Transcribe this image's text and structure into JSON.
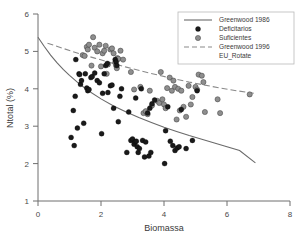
{
  "chart_data": {
    "type": "scatter",
    "title": "",
    "xlabel": "Biomassa",
    "ylabel": "Ntotal (%)",
    "xlim": [
      0,
      8
    ],
    "ylim": [
      1,
      6
    ],
    "xticks": [
      0,
      2,
      4,
      6,
      8
    ],
    "yticks": [
      1,
      2,
      3,
      4,
      5,
      6
    ],
    "grid": false,
    "legend_position": "top-right",
    "legend": [
      {
        "label": "Greenwood 1986",
        "marker": "line-solid",
        "color": "#6a6a6a"
      },
      {
        "label": "Deficitarios",
        "marker": "circle-filled-black",
        "color": "#1a1a1a"
      },
      {
        "label": "Suficientes",
        "marker": "circle-filled-gray",
        "color": "#8e8e8e"
      },
      {
        "label": "Greenwood 1996",
        "marker": "line-dashed",
        "color": "#8a8a8a"
      },
      {
        "label": "EU_Rotate",
        "marker": "none",
        "color": "#3a3a3a"
      }
    ],
    "series": [
      {
        "name": "Deficitarios",
        "marker": "circle-filled-black",
        "color": "#1a1a1a",
        "points": [
          [
            1.05,
            2.7
          ],
          [
            1.12,
            3.42
          ],
          [
            1.15,
            2.48
          ],
          [
            1.18,
            3.8
          ],
          [
            1.2,
            4.78
          ],
          [
            1.25,
            2.95
          ],
          [
            1.3,
            4.4
          ],
          [
            1.32,
            4.38
          ],
          [
            1.35,
            4.12
          ],
          [
            1.38,
            4.22
          ],
          [
            1.45,
            3.08
          ],
          [
            1.5,
            4.4
          ],
          [
            1.55,
            4.02
          ],
          [
            1.58,
            3.95
          ],
          [
            1.62,
            3.98
          ],
          [
            1.68,
            4.3
          ],
          [
            1.72,
            4.33
          ],
          [
            1.8,
            4.42
          ],
          [
            1.88,
            4.22
          ],
          [
            1.95,
            4.16
          ],
          [
            2.02,
            2.8
          ],
          [
            2.05,
            3.88
          ],
          [
            2.1,
            4.4
          ],
          [
            2.15,
            4.62
          ],
          [
            2.2,
            4.68
          ],
          [
            2.22,
            3.9
          ],
          [
            2.3,
            4.08
          ],
          [
            2.35,
            4.1
          ],
          [
            2.4,
            3.48
          ],
          [
            2.45,
            4.78
          ],
          [
            2.48,
            4.72
          ],
          [
            2.5,
            4.62
          ],
          [
            2.55,
            3.12
          ],
          [
            2.6,
            3.8
          ],
          [
            2.65,
            4.0
          ],
          [
            2.82,
            2.3
          ],
          [
            2.88,
            3.38
          ],
          [
            2.95,
            2.62
          ],
          [
            3.0,
            2.66
          ],
          [
            3.05,
            2.52
          ],
          [
            3.08,
            2.58
          ],
          [
            3.1,
            3.75
          ],
          [
            3.12,
            2.6
          ],
          [
            3.15,
            2.45
          ],
          [
            3.18,
            2.3
          ],
          [
            3.22,
            2.4
          ],
          [
            3.28,
            4.0
          ],
          [
            3.32,
            2.62
          ],
          [
            3.38,
            2.18
          ],
          [
            3.42,
            2.58
          ],
          [
            3.48,
            3.35
          ],
          [
            3.52,
            2.2
          ],
          [
            3.55,
            3.48
          ],
          [
            3.58,
            2.3
          ],
          [
            3.62,
            3.6
          ],
          [
            3.7,
            3.7
          ],
          [
            4.02,
            2.0
          ],
          [
            4.05,
            2.88
          ],
          [
            4.12,
            3.52
          ],
          [
            4.2,
            2.6
          ],
          [
            4.28,
            2.48
          ],
          [
            4.35,
            2.35
          ],
          [
            4.42,
            2.42
          ],
          [
            4.48,
            2.45
          ],
          [
            4.55,
            3.45
          ],
          [
            4.7,
            2.4
          ],
          [
            4.9,
            2.62
          ],
          [
            5.05,
            3.95
          ]
        ]
      },
      {
        "name": "Suficientes",
        "marker": "circle-filled-gray",
        "color": "#8e8e8e",
        "points": [
          [
            1.42,
            4.9
          ],
          [
            1.48,
            4.88
          ],
          [
            1.55,
            5.12
          ],
          [
            1.58,
            5.05
          ],
          [
            1.62,
            5.18
          ],
          [
            1.7,
            4.62
          ],
          [
            1.75,
            5.38
          ],
          [
            1.8,
            5.1
          ],
          [
            1.88,
            5.0
          ],
          [
            1.95,
            5.18
          ],
          [
            2.0,
            4.6
          ],
          [
            2.05,
            4.95
          ],
          [
            2.1,
            5.02
          ],
          [
            2.15,
            5.15
          ],
          [
            2.18,
            4.4
          ],
          [
            2.22,
            4.65
          ],
          [
            2.3,
            5.05
          ],
          [
            2.35,
            5.08
          ],
          [
            2.4,
            4.95
          ],
          [
            2.45,
            4.7
          ],
          [
            2.48,
            4.62
          ],
          [
            2.5,
            4.55
          ],
          [
            2.52,
            4.82
          ],
          [
            2.55,
            4.8
          ],
          [
            2.62,
            5.02
          ],
          [
            2.7,
            4.78
          ],
          [
            2.95,
            4.45
          ],
          [
            3.05,
            3.98
          ],
          [
            3.25,
            4.05
          ],
          [
            3.35,
            3.35
          ],
          [
            3.42,
            3.4
          ],
          [
            3.48,
            3.32
          ],
          [
            3.55,
            3.95
          ],
          [
            3.62,
            3.55
          ],
          [
            3.78,
            3.68
          ],
          [
            3.85,
            3.62
          ],
          [
            3.9,
            4.45
          ],
          [
            3.95,
            3.72
          ],
          [
            4.0,
            3.58
          ],
          [
            4.05,
            3.48
          ],
          [
            4.1,
            4.02
          ],
          [
            4.18,
            4.3
          ],
          [
            4.25,
            3.95
          ],
          [
            4.3,
            4.22
          ],
          [
            4.35,
            4.05
          ],
          [
            4.4,
            3.18
          ],
          [
            4.45,
            4.0
          ],
          [
            4.5,
            3.42
          ],
          [
            4.55,
            3.95
          ],
          [
            4.62,
            3.52
          ],
          [
            4.7,
            3.25
          ],
          [
            4.78,
            4.08
          ],
          [
            4.85,
            3.58
          ],
          [
            4.9,
            3.78
          ],
          [
            5.0,
            4.05
          ],
          [
            5.05,
            3.98
          ],
          [
            5.1,
            4.38
          ],
          [
            5.2,
            4.35
          ],
          [
            5.25,
            4.18
          ],
          [
            5.3,
            3.38
          ],
          [
            5.7,
            3.72
          ],
          [
            5.78,
            3.35
          ],
          [
            6.72,
            3.85
          ]
        ]
      }
    ],
    "curves": [
      {
        "name": "Greenwood 1986",
        "style": "solid",
        "color": "#6a6a6a",
        "points": [
          [
            0.0,
            5.38
          ],
          [
            0.2,
            5.13
          ],
          [
            0.4,
            4.9
          ],
          [
            0.6,
            4.7
          ],
          [
            0.8,
            4.52
          ],
          [
            1.0,
            4.36
          ],
          [
            1.3,
            4.14
          ],
          [
            1.6,
            3.95
          ],
          [
            2.0,
            3.73
          ],
          [
            2.4,
            3.54
          ],
          [
            2.8,
            3.38
          ],
          [
            3.2,
            3.23
          ],
          [
            3.6,
            3.1
          ],
          [
            4.0,
            2.97
          ],
          [
            4.4,
            2.86
          ],
          [
            4.8,
            2.75
          ],
          [
            5.2,
            2.65
          ],
          [
            5.6,
            2.55
          ],
          [
            6.0,
            2.45
          ],
          [
            6.4,
            2.35
          ],
          [
            6.9,
            2.02
          ]
        ]
      },
      {
        "name": "Greenwood 1996",
        "style": "dashed",
        "color": "#8a8a8a",
        "points": [
          [
            0.3,
            5.22
          ],
          [
            0.8,
            5.08
          ],
          [
            1.3,
            4.94
          ],
          [
            1.8,
            4.82
          ],
          [
            2.3,
            4.7
          ],
          [
            2.8,
            4.58
          ],
          [
            3.3,
            4.47
          ],
          [
            3.8,
            4.37
          ],
          [
            4.3,
            4.27
          ],
          [
            4.8,
            4.18
          ],
          [
            5.3,
            4.1
          ],
          [
            5.8,
            4.02
          ],
          [
            6.3,
            3.95
          ],
          [
            6.85,
            3.88
          ]
        ]
      }
    ]
  },
  "axes": {
    "x_tick_labels": [
      "0",
      "2",
      "4",
      "6",
      "8"
    ],
    "y_tick_labels": [
      "1",
      "2",
      "3",
      "4",
      "5",
      "6"
    ]
  }
}
